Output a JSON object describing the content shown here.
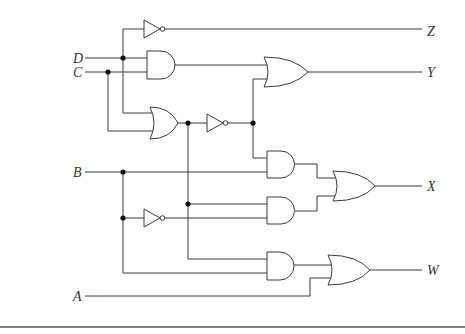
{
  "diagram": {
    "type": "logic-circuit",
    "inputs": [
      {
        "id": "D",
        "label": "D"
      },
      {
        "id": "C",
        "label": "C"
      },
      {
        "id": "B",
        "label": "B"
      },
      {
        "id": "A",
        "label": "A"
      }
    ],
    "outputs": [
      {
        "id": "Z",
        "label": "Z"
      },
      {
        "id": "Y",
        "label": "Y"
      },
      {
        "id": "X",
        "label": "X"
      },
      {
        "id": "W",
        "label": "W"
      }
    ],
    "gates": [
      {
        "id": "not1",
        "type": "NOT",
        "inputs": [
          "D"
        ],
        "output": "Z"
      },
      {
        "id": "and1",
        "type": "AND",
        "inputs": [
          "D",
          "C"
        ]
      },
      {
        "id": "or1",
        "type": "OR",
        "inputs": [
          "D",
          "C"
        ]
      },
      {
        "id": "not2",
        "type": "NOT",
        "inputs": [
          "or1"
        ]
      },
      {
        "id": "or2",
        "type": "OR",
        "inputs": [
          "and1",
          "not2"
        ],
        "output": "Y"
      },
      {
        "id": "and2",
        "type": "AND",
        "inputs": [
          "not2",
          "B"
        ]
      },
      {
        "id": "not3",
        "type": "NOT",
        "inputs": [
          "B"
        ]
      },
      {
        "id": "and3",
        "type": "AND",
        "inputs": [
          "or1",
          "not3"
        ]
      },
      {
        "id": "or3",
        "type": "OR",
        "inputs": [
          "and2",
          "and3"
        ],
        "output": "X"
      },
      {
        "id": "and4",
        "type": "AND",
        "inputs": [
          "or1",
          "B"
        ]
      },
      {
        "id": "or4",
        "type": "OR",
        "inputs": [
          "and4",
          "A"
        ],
        "output": "W"
      }
    ]
  }
}
